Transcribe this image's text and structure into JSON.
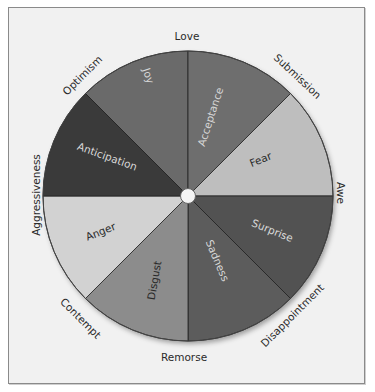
{
  "diagram": {
    "type": "emotion-wheel",
    "center_hub": "circle",
    "segments": [
      {
        "label": "Joy",
        "color": "#6a6a6a",
        "text_color": "#d8d8d8"
      },
      {
        "label": "Acceptance",
        "color": "#6e6e6e",
        "text_color": "#d8d8d8"
      },
      {
        "label": "Fear",
        "color": "#bebebe",
        "text_color": "#2a2a2a"
      },
      {
        "label": "Surprise",
        "color": "#525252",
        "text_color": "#d8d8d8"
      },
      {
        "label": "Sadness",
        "color": "#5c5c5c",
        "text_color": "#d8d8d8"
      },
      {
        "label": "Disgust",
        "color": "#8c8c8c",
        "text_color": "#2a2a2a"
      },
      {
        "label": "Anger",
        "color": "#d2d2d2",
        "text_color": "#2a2a2a"
      },
      {
        "label": "Anticipation",
        "color": "#3a3a3a",
        "text_color": "#d8d8d8"
      }
    ],
    "outer_labels": [
      {
        "label": "Love"
      },
      {
        "label": "Submission"
      },
      {
        "label": "Awe"
      },
      {
        "label": "Disappointment"
      },
      {
        "label": "Remorse"
      },
      {
        "label": "Contempt"
      },
      {
        "label": "Aggressiveness"
      },
      {
        "label": "Optimism"
      }
    ]
  }
}
